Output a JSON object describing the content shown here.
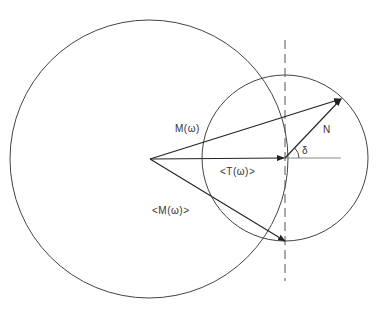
{
  "diagram": {
    "type": "phasor-geometry",
    "colors": {
      "stroke": "#333333",
      "light": "#888888",
      "background": "#ffffff"
    },
    "large_circle": {
      "cx": 149,
      "cy": 159,
      "r": 139
    },
    "small_circle": {
      "cx": 285,
      "cy": 158,
      "r": 83
    },
    "origin": {
      "x": 150,
      "y": 159
    },
    "dashed_line": {
      "x": 285,
      "y1": 40,
      "y2": 281
    },
    "reference_line": {
      "x1": 285,
      "y1": 158,
      "x2": 341,
      "y2": 158
    },
    "vectors": [
      {
        "name": "M(ω)",
        "x1": 150,
        "y1": 159,
        "x2": 341,
        "y2": 99
      },
      {
        "name": "<T(ω)>",
        "x1": 150,
        "y1": 159,
        "x2": 284,
        "y2": 158
      },
      {
        "name": "<M(ω)>",
        "x1": 150,
        "y1": 159,
        "x2": 285,
        "y2": 241
      },
      {
        "name": "N",
        "x1": 285,
        "y1": 158,
        "x2": 341,
        "y2": 99
      }
    ],
    "angle_arc": {
      "cx": 285,
      "cy": 158,
      "r": 14,
      "label": "δ"
    },
    "labels": {
      "m_omega": "M(ω)",
      "t_omega_avg": "<T(ω)>",
      "m_omega_avg": "<M(ω)>",
      "n": "N",
      "delta": "δ"
    }
  }
}
